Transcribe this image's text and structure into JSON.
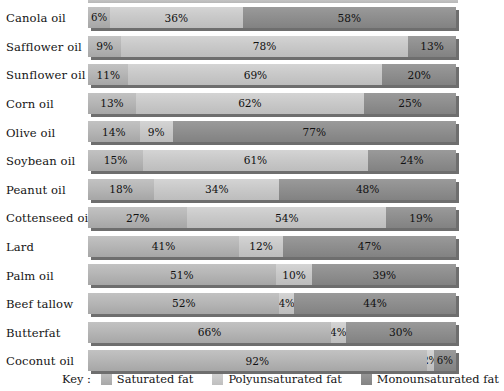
{
  "chart_data": {
    "type": "bar",
    "subtype": "stacked-horizontal-100pct",
    "title": "",
    "xlabel": "",
    "ylabel": "",
    "xlim": [
      0,
      100
    ],
    "grid": false,
    "legend_position": "bottom",
    "key_title": "Key :",
    "series": [
      {
        "name": "Saturated fat",
        "color": "#b6b6b6",
        "values": [
          6,
          9,
          11,
          13,
          14,
          15,
          18,
          27,
          41,
          51,
          52,
          66,
          92
        ]
      },
      {
        "name": "Polyunsaturated fat",
        "color": "#c9c9c9",
        "values": [
          36,
          78,
          69,
          62,
          9,
          61,
          34,
          54,
          12,
          10,
          4,
          4,
          2
        ]
      },
      {
        "name": "Monounsaturated fat",
        "color": "#8f8f8f",
        "values": [
          58,
          13,
          20,
          25,
          77,
          24,
          48,
          19,
          47,
          39,
          44,
          30,
          6
        ]
      }
    ],
    "categories": [
      "Canola oil",
      "Safflower oil",
      "Sunflower oil",
      "Corn oil",
      "Olive oil",
      "Soybean oil",
      "Peanut oil",
      "Cottenseed oil",
      "Lard",
      "Palm oil",
      "Beef tallow",
      "Butterfat",
      "Coconut oil"
    ],
    "rows": [
      {
        "label": "Canola oil",
        "segments": [
          {
            "series": "Saturated fat",
            "value": 6,
            "text": "6%"
          },
          {
            "series": "Polyunsaturated fat",
            "value": 36,
            "text": "36%"
          },
          {
            "series": "Monounsaturated fat",
            "value": 58,
            "text": "58%"
          }
        ]
      },
      {
        "label": "Safflower oil",
        "segments": [
          {
            "series": "Saturated fat",
            "value": 9,
            "text": "9%"
          },
          {
            "series": "Polyunsaturated fat",
            "value": 78,
            "text": "78%"
          },
          {
            "series": "Monounsaturated fat",
            "value": 13,
            "text": "13%"
          }
        ]
      },
      {
        "label": "Sunflower oil",
        "segments": [
          {
            "series": "Saturated fat",
            "value": 11,
            "text": "11%"
          },
          {
            "series": "Polyunsaturated fat",
            "value": 69,
            "text": "69%"
          },
          {
            "series": "Monounsaturated fat",
            "value": 20,
            "text": "20%"
          }
        ]
      },
      {
        "label": "Corn oil",
        "segments": [
          {
            "series": "Saturated fat",
            "value": 13,
            "text": "13%"
          },
          {
            "series": "Polyunsaturated fat",
            "value": 62,
            "text": "62%"
          },
          {
            "series": "Monounsaturated fat",
            "value": 25,
            "text": "25%"
          }
        ]
      },
      {
        "label": "Olive oil",
        "segments": [
          {
            "series": "Saturated fat",
            "value": 14,
            "text": "14%"
          },
          {
            "series": "Polyunsaturated fat",
            "value": 9,
            "text": "9%"
          },
          {
            "series": "Monounsaturated fat",
            "value": 77,
            "text": "77%"
          }
        ]
      },
      {
        "label": "Soybean oil",
        "segments": [
          {
            "series": "Saturated fat",
            "value": 15,
            "text": "15%"
          },
          {
            "series": "Polyunsaturated fat",
            "value": 61,
            "text": "61%"
          },
          {
            "series": "Monounsaturated fat",
            "value": 24,
            "text": "24%"
          }
        ]
      },
      {
        "label": "Peanut oil",
        "segments": [
          {
            "series": "Saturated fat",
            "value": 18,
            "text": "18%"
          },
          {
            "series": "Polyunsaturated fat",
            "value": 34,
            "text": "34%"
          },
          {
            "series": "Monounsaturated fat",
            "value": 48,
            "text": "48%"
          }
        ]
      },
      {
        "label": "Cottenseed oil",
        "segments": [
          {
            "series": "Saturated fat",
            "value": 27,
            "text": "27%"
          },
          {
            "series": "Polyunsaturated fat",
            "value": 54,
            "text": "54%"
          },
          {
            "series": "Monounsaturated fat",
            "value": 19,
            "text": "19%"
          }
        ]
      },
      {
        "label": "Lard",
        "segments": [
          {
            "series": "Saturated fat",
            "value": 41,
            "text": "41%"
          },
          {
            "series": "Polyunsaturated fat",
            "value": 12,
            "text": "12%"
          },
          {
            "series": "Monounsaturated fat",
            "value": 47,
            "text": "47%"
          }
        ]
      },
      {
        "label": "Palm oil",
        "segments": [
          {
            "series": "Saturated fat",
            "value": 51,
            "text": "51%"
          },
          {
            "series": "Polyunsaturated fat",
            "value": 10,
            "text": "10%"
          },
          {
            "series": "Monounsaturated fat",
            "value": 39,
            "text": "39%"
          }
        ]
      },
      {
        "label": "Beef tallow",
        "segments": [
          {
            "series": "Saturated fat",
            "value": 52,
            "text": "52%"
          },
          {
            "series": "Polyunsaturated fat",
            "value": 4,
            "text": "4%"
          },
          {
            "series": "Monounsaturated fat",
            "value": 44,
            "text": "44%"
          }
        ]
      },
      {
        "label": "Butterfat",
        "segments": [
          {
            "series": "Saturated fat",
            "value": 66,
            "text": "66%"
          },
          {
            "series": "Polyunsaturated fat",
            "value": 4,
            "text": "4%"
          },
          {
            "series": "Monounsaturated fat",
            "value": 30,
            "text": "30%"
          }
        ]
      },
      {
        "label": "Coconut oil",
        "segments": [
          {
            "series": "Saturated fat",
            "value": 92,
            "text": "92%"
          },
          {
            "series": "Polyunsaturated fat",
            "value": 2,
            "text": "2%"
          },
          {
            "series": "Monounsaturated fat",
            "value": 6,
            "text": "6%"
          }
        ]
      }
    ],
    "legend": [
      {
        "label": "Saturated fat",
        "swatch": "sat"
      },
      {
        "label": "Polyunsaturated fat",
        "swatch": "poly"
      },
      {
        "label": "Monounsaturated fat",
        "swatch": "mono"
      }
    ]
  }
}
